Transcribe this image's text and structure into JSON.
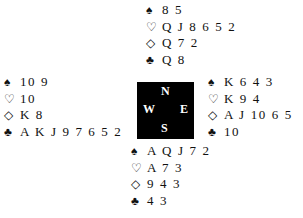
{
  "compass": {
    "n": "N",
    "e": "E",
    "s": "S",
    "w": "W"
  },
  "suits": {
    "spades": "♠",
    "hearts": "♡",
    "diamonds": "◇",
    "clubs": "♣"
  },
  "hands": {
    "north": {
      "spades": "8 5",
      "hearts": "Q J 8 6 5 2",
      "diamonds": "Q 7 2",
      "clubs": "Q 8"
    },
    "west": {
      "spades": "10 9",
      "hearts": "10",
      "diamonds": "K 8",
      "clubs": "A K J 9 7 6 5 2"
    },
    "east": {
      "spades": "K 6 4 3",
      "hearts": "K 9 4",
      "diamonds": "A J 10 6 5",
      "clubs": "10"
    },
    "south": {
      "spades": "A Q J 7 2",
      "hearts": "A 7 3",
      "diamonds": "9 4 3",
      "clubs": "4 3"
    }
  }
}
